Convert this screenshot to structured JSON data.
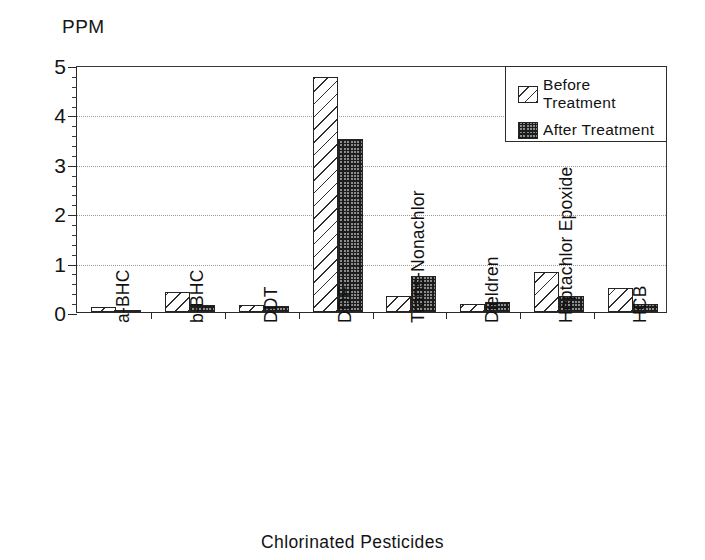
{
  "chart_data": {
    "type": "bar",
    "title": "",
    "ylabel": "PPM",
    "xlabel": "Chlorinated Pesticides",
    "ylim": [
      0,
      5
    ],
    "ytick_labels": [
      "0",
      "1",
      "2",
      "3",
      "4",
      "5"
    ],
    "ytick_values": [
      0,
      1,
      2,
      3,
      4,
      5
    ],
    "yminor_step": 0.2,
    "grid": "horizontal-dotted",
    "legend_position": "top-right-inside",
    "categories": [
      "a-BHC",
      "b-BHC",
      "DDT",
      "DDE",
      "Trans-Nonachlor",
      "Dieldren",
      "Heptachlor Epoxide",
      "HCB"
    ],
    "series": [
      {
        "name": "Before Treatment",
        "pattern": "diagonal-hatch",
        "values": [
          0.1,
          0.4,
          0.15,
          4.75,
          0.33,
          0.17,
          0.8,
          0.48
        ]
      },
      {
        "name": "After Treatment",
        "pattern": "cross-hatch-dark",
        "values": [
          0.02,
          0.15,
          0.13,
          3.5,
          0.73,
          0.21,
          0.32,
          0.17
        ]
      }
    ]
  },
  "legend": {
    "items": [
      {
        "label": "Before Treatment"
      },
      {
        "label": "After Treatment"
      }
    ]
  },
  "colors": {
    "axis": "#2a2a2a",
    "grid": "#9a9a9a",
    "before_fill": "#ffffff",
    "after_fill": "#8d8d8d",
    "text": "#111111"
  }
}
